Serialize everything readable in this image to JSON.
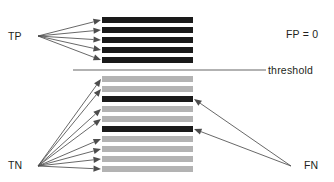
{
  "figure": {
    "width": 334,
    "height": 182,
    "background": "#ffffff"
  },
  "colors": {
    "positive_bar": "#1a1a1a",
    "negative_bar": "#b3b3b3",
    "threshold_line": "#999999",
    "arrow": "#4d4d4d",
    "text": "#231f20"
  },
  "labels": {
    "tp": "TP",
    "tn": "TN",
    "fp": "FP = 0",
    "fn": "FN",
    "threshold": "threshold"
  },
  "chart_data": {
    "type": "bar",
    "title": "",
    "orientation": "horizontal",
    "bar_left_x": 102,
    "bar_right_x": 193,
    "bar_height": 6,
    "bar_pitch": 10,
    "threshold": {
      "y": 70,
      "x_start": 73,
      "x_end": 266,
      "label": "threshold"
    },
    "above_threshold": {
      "count": 5,
      "classes": [
        "positive",
        "positive",
        "positive",
        "positive",
        "positive"
      ],
      "y": [
        17,
        27,
        37,
        47,
        57
      ],
      "group": "TP"
    },
    "below_threshold": {
      "count": 10,
      "classes": [
        "negative",
        "negative",
        "positive",
        "negative",
        "negative",
        "positive",
        "negative",
        "negative",
        "negative",
        "negative"
      ],
      "y": [
        76,
        86,
        96,
        106,
        116,
        126,
        136,
        146,
        156,
        166
      ],
      "groups": [
        "TN",
        "TN",
        "FN",
        "TN",
        "TN",
        "FN",
        "TN",
        "TN",
        "TN",
        "TN"
      ]
    },
    "counts": {
      "TP": 5,
      "FP": 0,
      "FN": 2,
      "TN": 8
    }
  },
  "arrow_groups": {
    "tp": {
      "origin_x": 38,
      "origin_y": 36,
      "targets_y": [
        20,
        30,
        40,
        50,
        60
      ],
      "target_x": 101
    },
    "tn": {
      "origin_x": 38,
      "origin_y": 166,
      "targets_y": [
        79,
        89,
        109,
        119,
        139,
        149,
        159,
        169
      ],
      "target_x": 101
    },
    "fn": {
      "origin_x": 291,
      "origin_y": 166,
      "targets_y": [
        99,
        129
      ],
      "target_x": 194
    }
  }
}
